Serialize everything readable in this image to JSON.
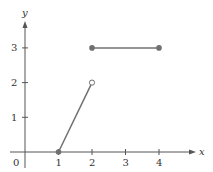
{
  "chart_data": {
    "type": "line",
    "title": "",
    "xlabel": "x",
    "ylabel": "y",
    "xlim": [
      0,
      4.9
    ],
    "ylim": [
      0,
      3.8
    ],
    "x_ticks": [
      "1",
      "2",
      "3",
      "4"
    ],
    "y_ticks": [
      "1",
      "2",
      "3"
    ],
    "origin_label": "0",
    "grid": false,
    "legend": null,
    "series": [
      {
        "name": "segment-1",
        "x": [
          1,
          2
        ],
        "y": [
          0,
          2
        ],
        "start_marker": "closed",
        "end_marker": "open"
      },
      {
        "name": "segment-2",
        "x": [
          2,
          4
        ],
        "y": [
          3,
          3
        ],
        "start_marker": "closed",
        "end_marker": "closed"
      }
    ]
  },
  "style": {
    "axis_color": "#555555",
    "line_color": "#707070",
    "marker_color": "#707070"
  }
}
